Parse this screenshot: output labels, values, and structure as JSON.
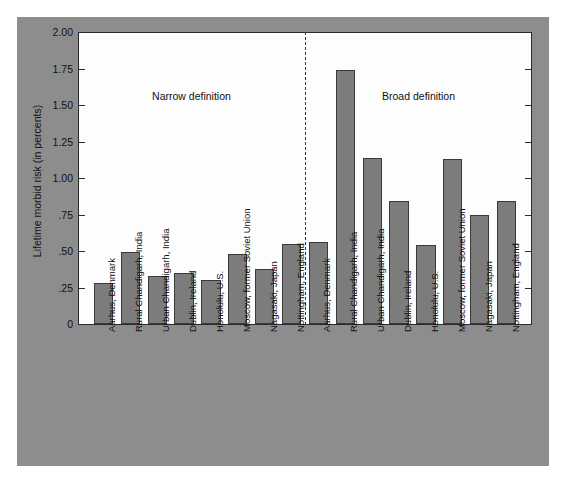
{
  "chart_data": {
    "type": "bar",
    "title": "",
    "xlabel": "",
    "ylabel": "Lifetime morbid risk (in percents)",
    "ylim": [
      0,
      2.0
    ],
    "ytick_labels": [
      "2.00",
      "1.75",
      "1.50",
      "1.25",
      "1.00",
      ".75",
      ".50",
      ".25",
      "0"
    ],
    "ytick_values": [
      2.0,
      1.75,
      1.5,
      1.25,
      1.0,
      0.75,
      0.5,
      0.25,
      0
    ],
    "grid": false,
    "legend": "none",
    "annotations": [
      "Narrow definition",
      "Broad definition"
    ],
    "groups": [
      {
        "name": "Narrow definition",
        "categories": [
          "Aarhus, Denmark",
          "Rural Chandigarh, India",
          "Urban Chandigarh, India",
          "Dublin, Ireland",
          "Honolulu, U.S.",
          "Moscow, former Soviet Union",
          "Nagasaki, Japan",
          "Nottingham, England"
        ],
        "values": [
          0.28,
          0.49,
          0.33,
          0.35,
          0.3,
          0.48,
          0.38,
          0.55
        ]
      },
      {
        "name": "Broad definition",
        "categories": [
          "Aarhus, Denmark",
          "Rural Chandigarh, India",
          "Urban Chandigarh, India",
          "Dublin, Ireland",
          "Honolulu, U.S.",
          "Moscow, former Soviet Union",
          "Nagasaki, Japan",
          "Nottingham, England"
        ],
        "values": [
          0.56,
          1.74,
          1.14,
          0.84,
          0.54,
          1.13,
          0.75,
          0.84
        ]
      }
    ],
    "colors": {
      "bar_fill": "#7c7c7c",
      "bar_stroke": "#3a3a3a",
      "panel_background": "#8d8d8d",
      "plot_background": "#fdfdfd",
      "axis": "#2b2b2b",
      "divider": "#333333"
    }
  }
}
